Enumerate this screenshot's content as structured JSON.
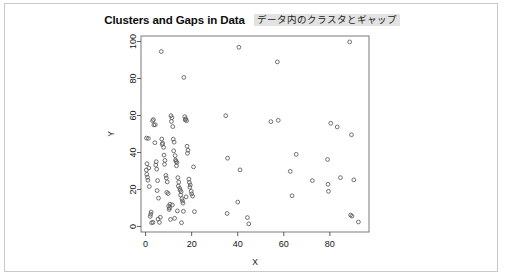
{
  "card": {
    "background_color": "#ffffff",
    "border_color": "#c8c8c8"
  },
  "header": {
    "title": "Clusters and Gaps in Data",
    "annotation": "データ内のクラスタとギャップ",
    "annotation_highlight_color": "#e2e2e2"
  },
  "chart_data": {
    "type": "scatter",
    "title": "Clusters and Gaps in Data",
    "subtitle": "データ内のクラスタとギャップ",
    "xlabel": "X",
    "ylabel": "Y",
    "xlim": [
      -2,
      97
    ],
    "ylim": [
      -3,
      103
    ],
    "xticks": [
      0,
      20,
      40,
      60,
      80
    ],
    "yticks": [
      0,
      20,
      40,
      60,
      80,
      100
    ],
    "grid": false,
    "legend": null,
    "marker": "open-circle",
    "marker_color": "#595959",
    "annotations": [
      "Dense cluster of points for X between 0 and 22",
      "Visible gap band for X between about 22 and 33",
      "Sparse uniformly scattered points for X above 33"
    ],
    "points": [
      [
        0.4,
        47.8
      ],
      [
        1.2,
        47.6
      ],
      [
        0.6,
        33.9
      ],
      [
        0.3,
        30.5
      ],
      [
        0.5,
        28.2
      ],
      [
        0.8,
        26.6
      ],
      [
        1.0,
        25.0
      ],
      [
        1.4,
        31.6
      ],
      [
        1.6,
        21.6
      ],
      [
        2.2,
        6.6
      ],
      [
        2.4,
        7.8
      ],
      [
        2.0,
        5.4
      ],
      [
        2.6,
        2.0
      ],
      [
        3.2,
        2.2
      ],
      [
        3.4,
        57.8
      ],
      [
        3.0,
        57.2
      ],
      [
        3.6,
        54.9
      ],
      [
        4.2,
        55.0
      ],
      [
        4.0,
        45.3
      ],
      [
        4.6,
        35.0
      ],
      [
        4.4,
        33.2
      ],
      [
        4.8,
        31.0
      ],
      [
        5.2,
        24.8
      ],
      [
        5.0,
        19.4
      ],
      [
        5.6,
        15.3
      ],
      [
        5.4,
        4.0
      ],
      [
        6.0,
        2.2
      ],
      [
        6.4,
        5.0
      ],
      [
        6.8,
        94.6
      ],
      [
        7.0,
        47.3
      ],
      [
        7.4,
        45.0
      ],
      [
        7.2,
        44.4
      ],
      [
        7.8,
        42.8
      ],
      [
        8.0,
        38.6
      ],
      [
        8.4,
        35.7
      ],
      [
        8.2,
        33.6
      ],
      [
        8.8,
        27.6
      ],
      [
        9.0,
        26.2
      ],
      [
        9.4,
        24.1
      ],
      [
        9.2,
        18.4
      ],
      [
        9.8,
        17.8
      ],
      [
        10.0,
        11.0
      ],
      [
        10.4,
        10.0
      ],
      [
        10.2,
        9.2
      ],
      [
        10.8,
        3.8
      ],
      [
        11.0,
        59.9
      ],
      [
        11.4,
        58.8
      ],
      [
        11.2,
        56.8
      ],
      [
        11.8,
        54.0
      ],
      [
        12.0,
        47.2
      ],
      [
        12.4,
        45.6
      ],
      [
        12.2,
        40.9
      ],
      [
        12.8,
        38.3
      ],
      [
        13.0,
        35.9
      ],
      [
        13.2,
        35.2
      ],
      [
        13.6,
        34.6
      ],
      [
        13.4,
        32.8
      ],
      [
        14.0,
        26.4
      ],
      [
        14.4,
        24.0
      ],
      [
        14.2,
        21.8
      ],
      [
        14.8,
        20.6
      ],
      [
        15.0,
        19.6
      ],
      [
        15.4,
        18.8
      ],
      [
        15.2,
        17.0
      ],
      [
        15.8,
        15.0
      ],
      [
        16.0,
        13.8
      ],
      [
        16.2,
        12.6
      ],
      [
        16.6,
        80.6
      ],
      [
        17.0,
        59.4
      ],
      [
        17.4,
        58.2
      ],
      [
        17.2,
        57.6
      ],
      [
        17.8,
        57.2
      ],
      [
        18.0,
        43.4
      ],
      [
        18.4,
        41.2
      ],
      [
        18.2,
        39.6
      ],
      [
        18.8,
        25.6
      ],
      [
        19.0,
        23.8
      ],
      [
        19.4,
        22.4
      ],
      [
        19.2,
        21.2
      ],
      [
        19.8,
        19.0
      ],
      [
        20.0,
        17.6
      ],
      [
        20.4,
        16.4
      ],
      [
        16.4,
        8.2
      ],
      [
        15.6,
        2.0
      ],
      [
        12.6,
        4.4
      ],
      [
        11.6,
        11.6
      ],
      [
        10.6,
        12.0
      ],
      [
        13.8,
        8.4
      ],
      [
        17.6,
        16.0
      ],
      [
        20.8,
        32.2
      ],
      [
        21.2,
        8.0
      ],
      [
        34.8,
        59.9
      ],
      [
        35.6,
        36.9
      ],
      [
        35.4,
        7.0
      ],
      [
        40.5,
        96.9
      ],
      [
        41.0,
        30.6
      ],
      [
        40.0,
        13.2
      ],
      [
        44.2,
        4.8
      ],
      [
        44.8,
        1.4
      ],
      [
        54.4,
        56.7
      ],
      [
        57.6,
        57.4
      ],
      [
        57.2,
        89.0
      ],
      [
        62.8,
        29.8
      ],
      [
        63.6,
        16.6
      ],
      [
        65.4,
        39.0
      ],
      [
        72.4,
        24.8
      ],
      [
        79.0,
        36.2
      ],
      [
        79.2,
        22.8
      ],
      [
        79.4,
        19.0
      ],
      [
        80.4,
        55.8
      ],
      [
        83.2,
        53.8
      ],
      [
        84.6,
        26.4
      ],
      [
        88.6,
        99.8
      ],
      [
        89.4,
        49.6
      ],
      [
        90.4,
        25.2
      ],
      [
        89.0,
        6.2
      ],
      [
        89.6,
        5.6
      ],
      [
        92.4,
        2.4
      ]
    ]
  },
  "axes": {
    "x_label": "X",
    "y_label": "Y",
    "x_tick_labels": [
      "0",
      "20",
      "40",
      "60",
      "80"
    ],
    "y_tick_labels": [
      "0",
      "20",
      "40",
      "60",
      "80",
      "100"
    ]
  }
}
